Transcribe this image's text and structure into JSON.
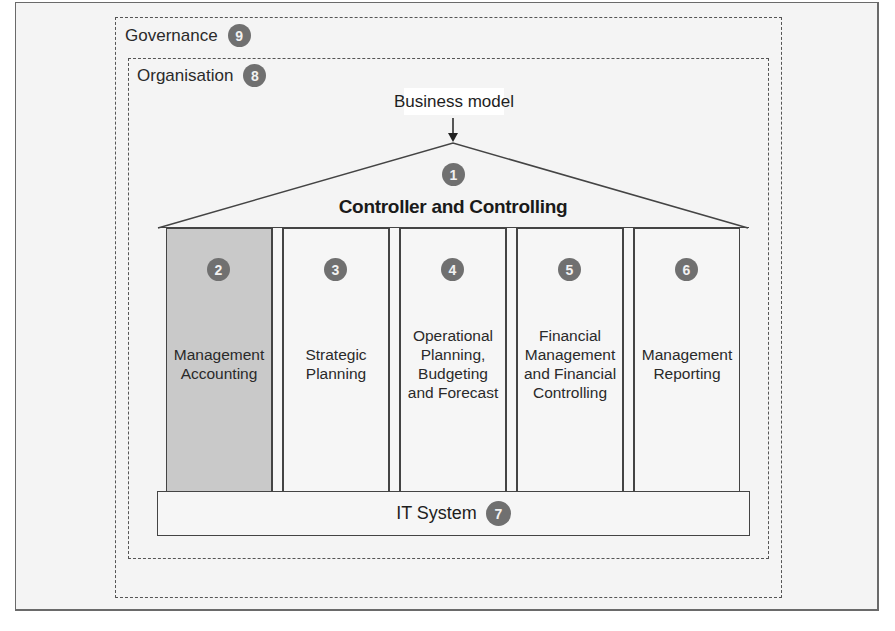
{
  "diagram": {
    "governance": {
      "label": "Governance",
      "number": "9"
    },
    "organisation": {
      "label": "Organisation",
      "number": "8"
    },
    "business_model": {
      "label": "Business model"
    },
    "roof": {
      "title": "Controller and Controlling",
      "number": "1"
    },
    "pillars": [
      {
        "number": "2",
        "label": "Management\nAccounting",
        "highlighted": true
      },
      {
        "number": "3",
        "label": "Strategic\nPlanning",
        "highlighted": false
      },
      {
        "number": "4",
        "label": "Operational\nPlanning,\nBudgeting\nand Forecast",
        "highlighted": false
      },
      {
        "number": "5",
        "label": "Financial\nManagement\nand Financial\nControlling",
        "highlighted": false
      },
      {
        "number": "6",
        "label": "Management\nReporting",
        "highlighted": false
      }
    ],
    "foundation": {
      "label": "IT System",
      "number": "7"
    },
    "colors": {
      "badge": "#707070",
      "highlight_fill": "#c9c9c9",
      "line": "#444444"
    }
  }
}
